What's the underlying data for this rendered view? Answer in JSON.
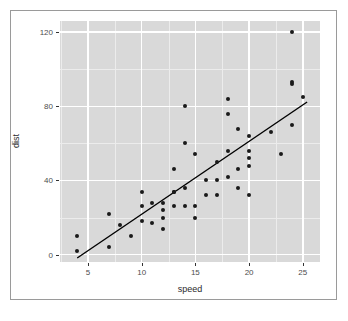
{
  "figure": {
    "width": 348,
    "height": 321,
    "background_color": "#ffffff",
    "frame_color": "#9a9a9a"
  },
  "panel": {
    "background_color": "#d9d9d9",
    "major_grid_color": "#ffffff",
    "minor_grid_color": "#ececec",
    "left": 60,
    "top": 21,
    "width": 260,
    "height": 241
  },
  "axes": {
    "x": {
      "label": "speed",
      "ticks": [
        5,
        10,
        15,
        20,
        25
      ],
      "tick_labels": [
        "5",
        "10",
        "15",
        "20",
        "25"
      ],
      "minor_ticks": [
        2.5,
        7.5,
        12.5,
        17.5,
        22.5
      ],
      "range": [
        2.4,
        26.6
      ]
    },
    "y": {
      "label": "dist",
      "ticks": [
        0,
        40,
        80,
        120
      ],
      "tick_labels": [
        "0",
        "40",
        "80",
        "120"
      ],
      "minor_ticks": [
        20,
        60,
        100
      ],
      "range": [
        -4.0,
        126.0
      ]
    },
    "tick_label_color": "#4d4d4d",
    "axis_label_color": "#2b2b2b"
  },
  "chart_data": {
    "type": "scatter",
    "title": "",
    "xlabel": "speed",
    "ylabel": "dist",
    "xlim": [
      2.4,
      26.6
    ],
    "ylim": [
      -4.0,
      126.0
    ],
    "grid": true,
    "legend": "none",
    "point_color": "#1a1a1a",
    "point_size": 4,
    "x": [
      4,
      4,
      7,
      7,
      8,
      9,
      10,
      10,
      10,
      11,
      11,
      12,
      12,
      12,
      12,
      13,
      13,
      13,
      13,
      14,
      14,
      14,
      14,
      15,
      15,
      15,
      16,
      16,
      17,
      17,
      17,
      18,
      18,
      18,
      18,
      19,
      19,
      19,
      20,
      20,
      20,
      20,
      20,
      22,
      23,
      24,
      24,
      24,
      24,
      25
    ],
    "y": [
      2,
      10,
      4,
      22,
      16,
      10,
      18,
      26,
      34,
      17,
      28,
      14,
      20,
      24,
      28,
      26,
      34,
      34,
      46,
      26,
      36,
      60,
      80,
      20,
      26,
      54,
      32,
      40,
      32,
      40,
      50,
      42,
      56,
      76,
      84,
      36,
      46,
      68,
      32,
      48,
      52,
      56,
      64,
      66,
      54,
      70,
      92,
      93,
      120,
      85
    ],
    "series": [
      {
        "name": "cars",
        "type": "scatter",
        "points": [
          [
            4,
            2
          ],
          [
            4,
            10
          ],
          [
            7,
            4
          ],
          [
            7,
            22
          ],
          [
            8,
            16
          ],
          [
            9,
            10
          ],
          [
            10,
            18
          ],
          [
            10,
            26
          ],
          [
            10,
            34
          ],
          [
            11,
            17
          ],
          [
            11,
            28
          ],
          [
            12,
            14
          ],
          [
            12,
            20
          ],
          [
            12,
            24
          ],
          [
            12,
            28
          ],
          [
            13,
            26
          ],
          [
            13,
            34
          ],
          [
            13,
            34
          ],
          [
            13,
            46
          ],
          [
            14,
            26
          ],
          [
            14,
            36
          ],
          [
            14,
            60
          ],
          [
            14,
            80
          ],
          [
            15,
            20
          ],
          [
            15,
            26
          ],
          [
            15,
            54
          ],
          [
            16,
            32
          ],
          [
            16,
            40
          ],
          [
            17,
            32
          ],
          [
            17,
            40
          ],
          [
            17,
            50
          ],
          [
            18,
            42
          ],
          [
            18,
            56
          ],
          [
            18,
            76
          ],
          [
            18,
            84
          ],
          [
            19,
            36
          ],
          [
            19,
            46
          ],
          [
            19,
            68
          ],
          [
            20,
            32
          ],
          [
            20,
            48
          ],
          [
            20,
            52
          ],
          [
            20,
            56
          ],
          [
            20,
            64
          ],
          [
            22,
            66
          ],
          [
            23,
            54
          ],
          [
            24,
            70
          ],
          [
            24,
            92
          ],
          [
            24,
            93
          ],
          [
            24,
            120
          ],
          [
            25,
            85
          ]
        ]
      },
      {
        "name": "linear fit",
        "type": "line",
        "color": "#000000",
        "intercept": -17.579,
        "slope": 3.932,
        "x_start": 4.0,
        "x_end": 25.4,
        "y_start": -1.85,
        "y_end": 82.3
      }
    ]
  }
}
